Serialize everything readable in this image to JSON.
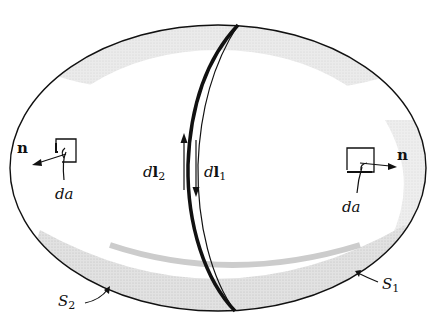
{
  "diagram": {
    "type": "closed-surface-split-into-two-surfaces",
    "labels": {
      "normal_left": "n",
      "normal_right": "n",
      "area_left": "da",
      "area_right": "da",
      "dl2": {
        "d": "d",
        "l": "l",
        "sub": "2"
      },
      "dl1": {
        "d": "d",
        "l": "l",
        "sub": "1"
      },
      "s2": {
        "S": "S",
        "sub": "2"
      },
      "s1": {
        "S": "S",
        "sub": "1"
      }
    },
    "colors": {
      "stroke": "#111111",
      "shade": "#d4d4d4",
      "background": "#ffffff"
    }
  }
}
